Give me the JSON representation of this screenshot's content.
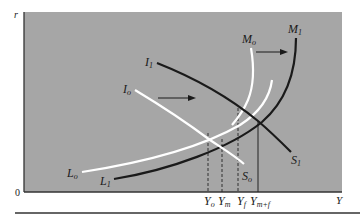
{
  "diagram": {
    "type": "IS-LM style macroeconomic diagram",
    "colors": {
      "plot_background": "#a6a6a6",
      "white_curves": "#ffffff",
      "black_curves": "#1a1a1a",
      "axis": "#333333"
    },
    "axes": {
      "y_label": "r",
      "x_label": "Y",
      "origin_label": "0"
    },
    "curves": [
      {
        "id": "I0",
        "base": "I",
        "sub": "o",
        "color": "white"
      },
      {
        "id": "I1",
        "base": "I",
        "sub": "1",
        "color": "black"
      },
      {
        "id": "S0",
        "base": "S",
        "sub": "o",
        "color": "white"
      },
      {
        "id": "S1",
        "base": "S",
        "sub": "1",
        "color": "black"
      },
      {
        "id": "M0",
        "base": "M",
        "sub": "o",
        "color": "white"
      },
      {
        "id": "M1",
        "base": "M",
        "sub": "1",
        "color": "black"
      },
      {
        "id": "L0",
        "base": "L",
        "sub": "o",
        "color": "white"
      },
      {
        "id": "L1",
        "base": "L",
        "sub": "1",
        "color": "black"
      }
    ],
    "x_markers": [
      {
        "base": "Y",
        "sub": "o",
        "style": "dashed"
      },
      {
        "base": "Y",
        "sub": "m",
        "style": "dashed"
      },
      {
        "base": "Y",
        "sub": "f",
        "style": "dashed"
      },
      {
        "base": "Y",
        "sub": "m+f",
        "style": "solid"
      }
    ],
    "arrows": [
      {
        "from": "I0",
        "to": "I1",
        "direction": "right"
      },
      {
        "from": "M0",
        "to": "M1",
        "direction": "right"
      }
    ]
  }
}
